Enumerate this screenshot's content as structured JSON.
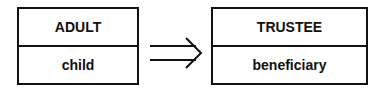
{
  "diagram": {
    "left_box": {
      "top": "ADULT",
      "bottom": "child"
    },
    "right_box": {
      "top": "TRUSTEE",
      "bottom": "beneficiary"
    },
    "connector": {
      "icon": "double-arrow-right-icon",
      "symbol": "⇒"
    },
    "colors": {
      "stroke": "#111111",
      "background": "#ffffff",
      "text": "#111111"
    }
  }
}
